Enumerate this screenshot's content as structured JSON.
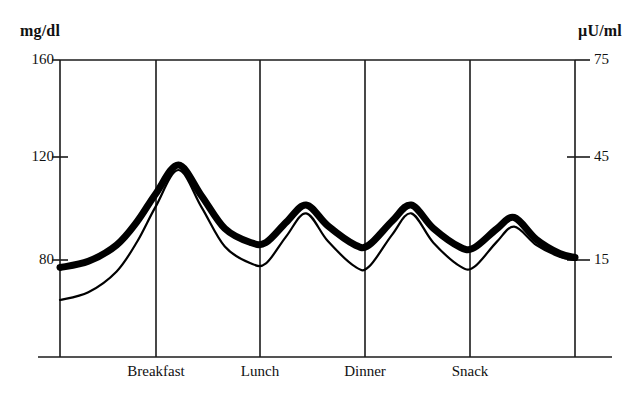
{
  "chart_data": {
    "type": "line",
    "title": "",
    "subtitle": "",
    "xlabel": "",
    "ylabel": "mg/dl",
    "y2label": "µU/ml",
    "grid": true,
    "legend_position": "none",
    "axes": {
      "left": {
        "unit": "mg/dl",
        "ticks": [
          160,
          120,
          80
        ],
        "tick_labels": [
          "160",
          "120",
          "80"
        ],
        "ylim": [
          33,
          160
        ]
      },
      "right": {
        "unit": "µU/ml",
        "ticks": [
          75,
          45,
          15
        ],
        "tick_labels": [
          "75",
          "45",
          "15"
        ],
        "ylim": [
          -7,
          75
        ]
      },
      "x": {
        "categories": [
          "Breakfast",
          "Lunch",
          "Dinner",
          "Snack"
        ],
        "gridline_count": 6
      }
    },
    "series": [
      {
        "name": "Glucose",
        "axis": "left",
        "unit": "mg/dl",
        "style": "thick-line",
        "color": "#000000",
        "x": [
          0,
          0.06,
          0.12,
          0.18,
          0.24,
          0.3,
          0.36,
          0.42,
          0.46,
          0.5,
          0.55,
          0.62,
          0.7,
          0.78,
          0.86,
          0.94,
          1.0
        ],
        "key_points": {
          "start": 77,
          "peak_breakfast": 118,
          "trough_after_breakfast": 87,
          "peak_lunch": 102,
          "trough_after_lunch": 86,
          "peak_dinner": 102,
          "trough_after_dinner": 85,
          "peak_snack": 97,
          "end": 81
        },
        "values": [
          77,
          78,
          82,
          92,
          106,
          117,
          118,
          110,
          96,
          88,
          87,
          96,
          102,
          98,
          88,
          86,
          81
        ]
      },
      {
        "name": "Insulin",
        "axis": "right",
        "unit": "µU/ml",
        "style": "thin-line",
        "color": "#000000",
        "key_points": {
          "start": 3,
          "peak_breakfast": 42,
          "trough_after_breakfast": 14,
          "peak_lunch": 29,
          "trough_after_lunch": 13,
          "peak_dinner": 29,
          "trough_after_dinner": 13,
          "peak_snack": 25,
          "end": 15
        },
        "values": [
          3,
          6,
          12,
          22,
          34,
          41,
          42,
          34,
          21,
          15,
          14,
          23,
          29,
          24,
          16,
          14,
          15
        ]
      }
    ],
    "annotations": []
  },
  "axis_left_unit": "mg/dl",
  "axis_right_unit": "µU/ml",
  "ticks_left": {
    "t0": "160",
    "t1": "120",
    "t2": "80"
  },
  "ticks_right": {
    "t0": "75",
    "t1": "45",
    "t2": "15"
  },
  "meals": {
    "m0": "Breakfast",
    "m1": "Lunch",
    "m2": "Dinner",
    "m3": "Snack"
  },
  "colors": {
    "ink": "#000000",
    "axis": "#1b1b1b",
    "background": "#ffffff"
  }
}
